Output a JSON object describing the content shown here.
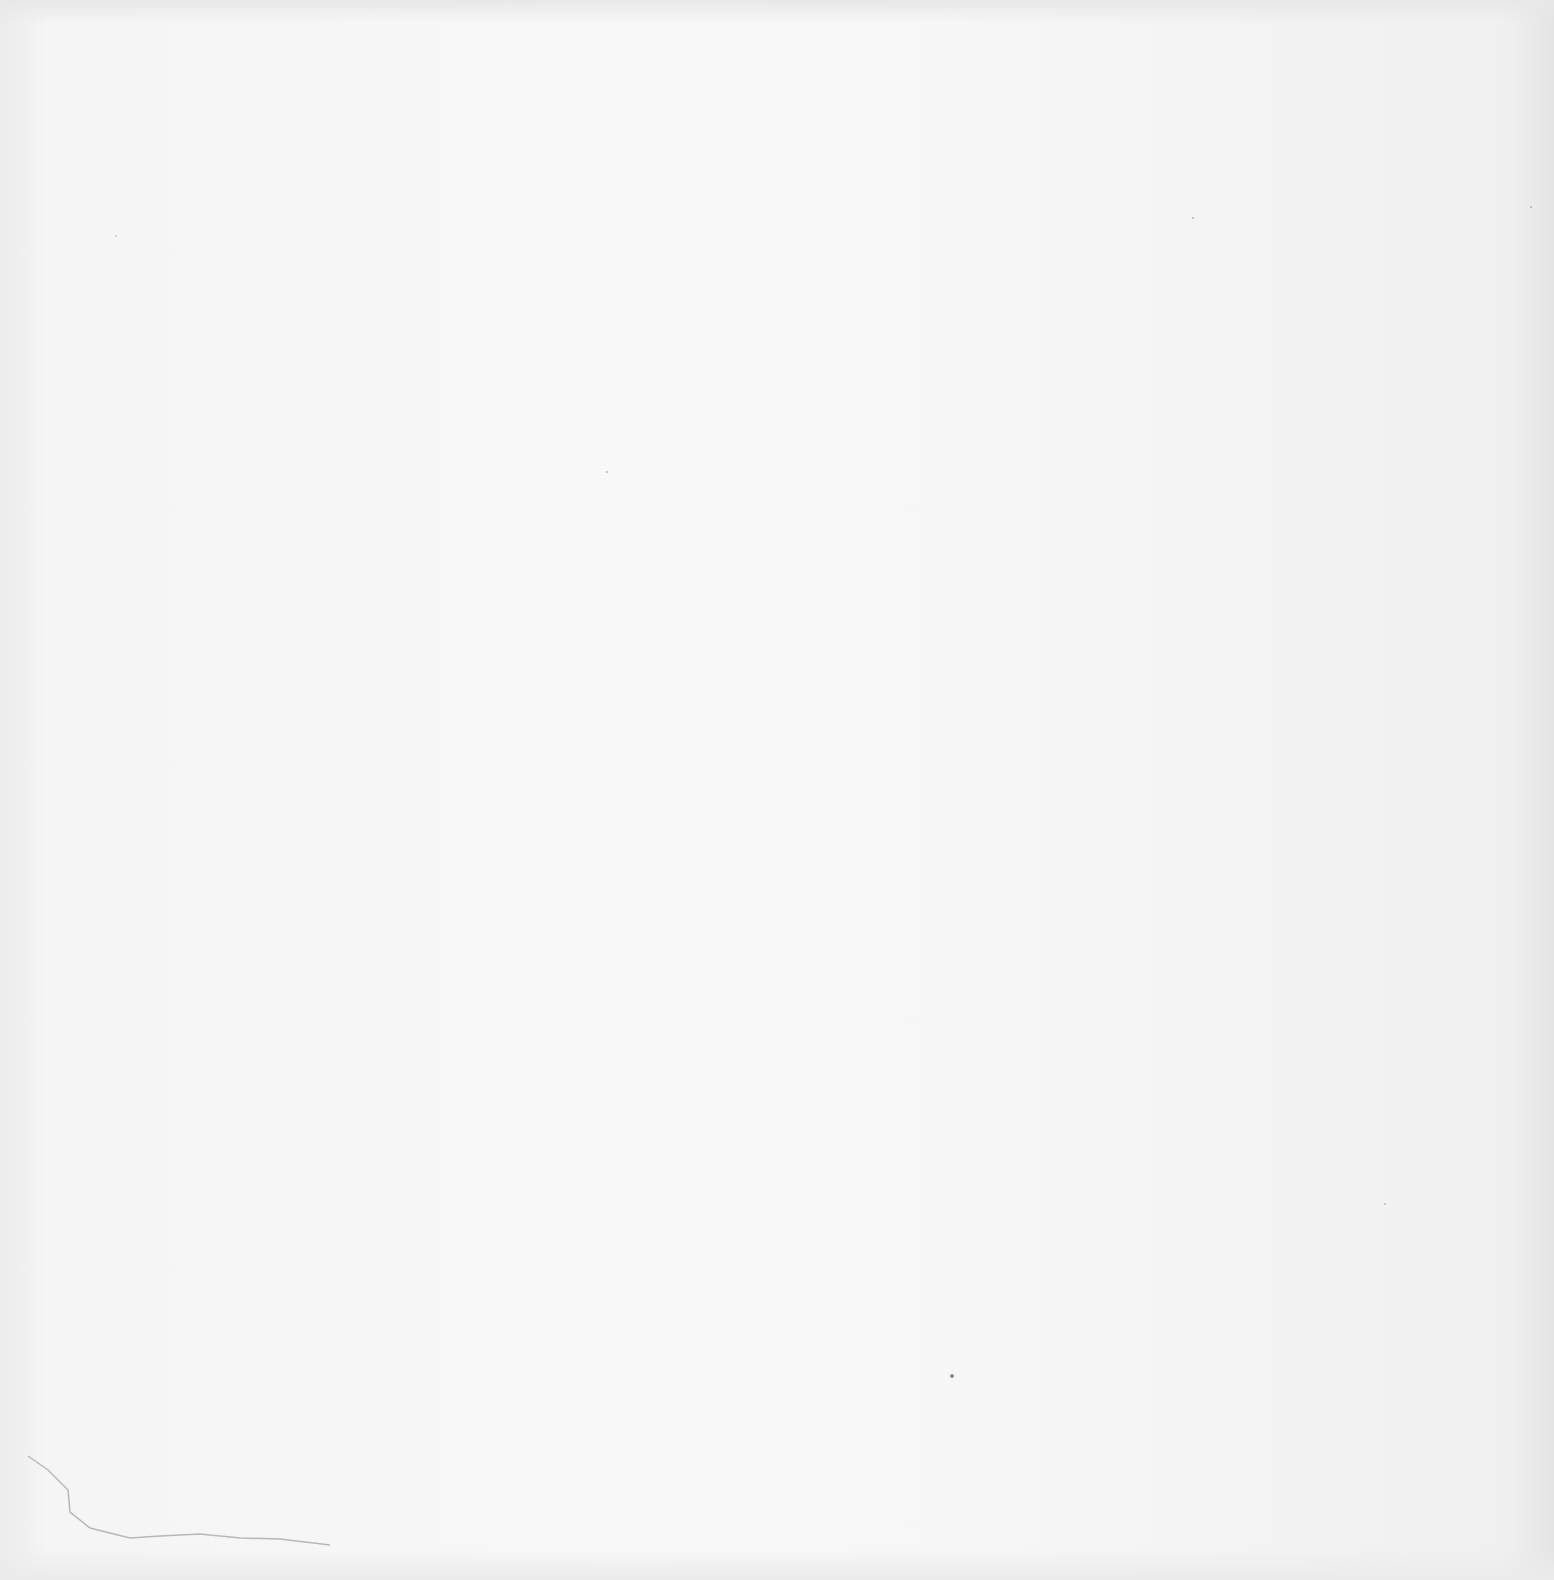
{
  "page": {
    "type": "blank scanned page",
    "background_color": "#f6f6f6",
    "content_text": ""
  },
  "artifacts": {
    "specks": [
      {
        "x": 950,
        "y": 1374,
        "r": 2
      },
      {
        "x": 606,
        "y": 471,
        "r": 1
      },
      {
        "x": 1192,
        "y": 217,
        "r": 1
      },
      {
        "x": 1530,
        "y": 206,
        "r": 1
      },
      {
        "x": 1384,
        "y": 1203,
        "r": 1
      },
      {
        "x": 115,
        "y": 235,
        "r": 1
      }
    ],
    "crease": "faint tear/crease line near lower-left corner"
  }
}
